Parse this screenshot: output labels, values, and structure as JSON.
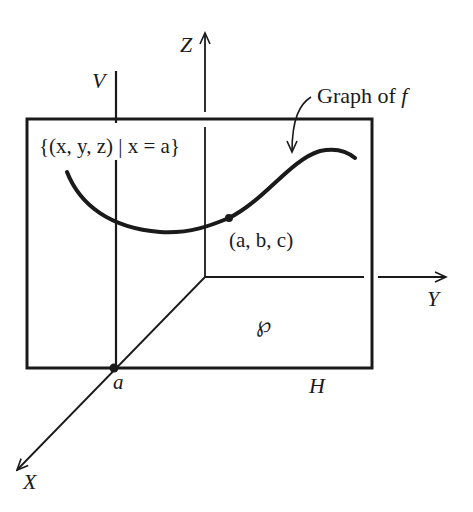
{
  "figure": {
    "axes": {
      "x_label": "X",
      "y_label": "Y",
      "z_label": "Z"
    },
    "plane_vertical_label": "V",
    "plane_horizontal_label": "H",
    "region_label": "℘",
    "set_label": "{(x, y, z) | x = a}",
    "curve_label": "Graph of f",
    "curve_label_text": "Graph of ",
    "curve_label_var": "f",
    "point_label": "(a, b, c)",
    "point_a_label": "a",
    "colors": {
      "ink": "#1a1a1a",
      "background": "#ffffff"
    }
  }
}
